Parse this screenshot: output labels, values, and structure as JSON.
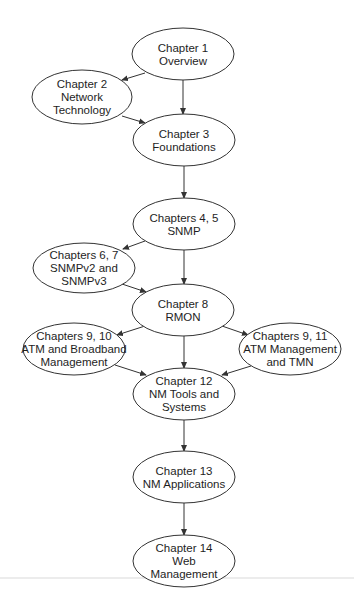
{
  "diagram": {
    "type": "flowchart",
    "colors": {
      "background": "#ffffff",
      "stroke": "#333333",
      "text": "#1e1e1e"
    },
    "nodes": [
      {
        "id": "ch1",
        "cx": 183,
        "cy": 54,
        "rx": 51,
        "ry": 26,
        "lines": [
          "Chapter 1",
          "Overview"
        ]
      },
      {
        "id": "ch2",
        "cx": 82,
        "cy": 97,
        "rx": 50,
        "ry": 27,
        "lines": [
          "Chapter 2",
          "Network",
          "Technology"
        ]
      },
      {
        "id": "ch3",
        "cx": 184,
        "cy": 140,
        "rx": 51,
        "ry": 26,
        "lines": [
          "Chapter 3",
          "Foundations"
        ]
      },
      {
        "id": "ch4_5",
        "cx": 184,
        "cy": 224,
        "rx": 51,
        "ry": 26,
        "lines": [
          "Chapters 4, 5",
          "SNMP"
        ]
      },
      {
        "id": "ch6_7",
        "cx": 84,
        "cy": 268,
        "rx": 51,
        "ry": 25,
        "lines": [
          "Chapters 6, 7",
          "SNMPv2 and",
          "SNMPv3"
        ]
      },
      {
        "id": "ch8",
        "cx": 183,
        "cy": 310,
        "rx": 51,
        "ry": 26,
        "lines": [
          "Chapter 8",
          "RMON"
        ]
      },
      {
        "id": "ch9_10",
        "cx": 74,
        "cy": 349,
        "rx": 51,
        "ry": 26,
        "lines": [
          "Chapters 9, 10",
          "ATM and Broadband",
          "Management"
        ]
      },
      {
        "id": "ch9_11",
        "cx": 290,
        "cy": 349,
        "rx": 51,
        "ry": 26,
        "lines": [
          "Chapters 9, 11",
          "ATM Management",
          "and TMN"
        ]
      },
      {
        "id": "ch12",
        "cx": 184,
        "cy": 394,
        "rx": 51,
        "ry": 26,
        "lines": [
          "Chapter 12",
          "NM Tools and",
          "Systems"
        ]
      },
      {
        "id": "ch13",
        "cx": 184,
        "cy": 477,
        "rx": 51,
        "ry": 26,
        "lines": [
          "Chapter 13",
          "NM Applications"
        ]
      },
      {
        "id": "ch14",
        "cx": 184,
        "cy": 561,
        "rx": 51,
        "ry": 26,
        "lines": [
          "Chapter 14",
          "Web",
          "Management"
        ]
      }
    ],
    "edges": [
      {
        "from": "ch1",
        "to": "ch2",
        "x1": 145,
        "y1": 73,
        "x2": 122,
        "y2": 80
      },
      {
        "from": "ch1",
        "to": "ch3",
        "x1": 183,
        "y1": 80,
        "x2": 183,
        "y2": 114
      },
      {
        "from": "ch2",
        "to": "ch3",
        "x1": 122,
        "y1": 116,
        "x2": 145,
        "y2": 123
      },
      {
        "from": "ch3",
        "to": "ch4_5",
        "x1": 184,
        "y1": 166,
        "x2": 184,
        "y2": 198
      },
      {
        "from": "ch4_5",
        "to": "ch6_7",
        "x1": 145,
        "y1": 241,
        "x2": 123,
        "y2": 249
      },
      {
        "from": "ch4_5",
        "to": "ch8",
        "x1": 184,
        "y1": 250,
        "x2": 184,
        "y2": 284
      },
      {
        "from": "ch6_7",
        "to": "ch8",
        "x1": 122,
        "y1": 284,
        "x2": 146,
        "y2": 292
      },
      {
        "from": "ch8",
        "to": "ch9_10",
        "x1": 145,
        "y1": 326,
        "x2": 117,
        "y2": 335
      },
      {
        "from": "ch8",
        "to": "ch9_11",
        "x1": 222,
        "y1": 326,
        "x2": 248,
        "y2": 335
      },
      {
        "from": "ch8",
        "to": "ch12",
        "x1": 184,
        "y1": 336,
        "x2": 184,
        "y2": 368
      },
      {
        "from": "ch9_10",
        "to": "ch12",
        "x1": 115,
        "y1": 365,
        "x2": 146,
        "y2": 375
      },
      {
        "from": "ch9_11",
        "to": "ch12",
        "x1": 251,
        "y1": 366,
        "x2": 222,
        "y2": 375
      },
      {
        "from": "ch12",
        "to": "ch13",
        "x1": 184,
        "y1": 420,
        "x2": 184,
        "y2": 451
      },
      {
        "from": "ch13",
        "to": "ch14",
        "x1": 184,
        "y1": 503,
        "x2": 184,
        "y2": 535
      }
    ],
    "scan_artifact": {
      "y": 578,
      "x1": 0,
      "x2": 354
    }
  }
}
